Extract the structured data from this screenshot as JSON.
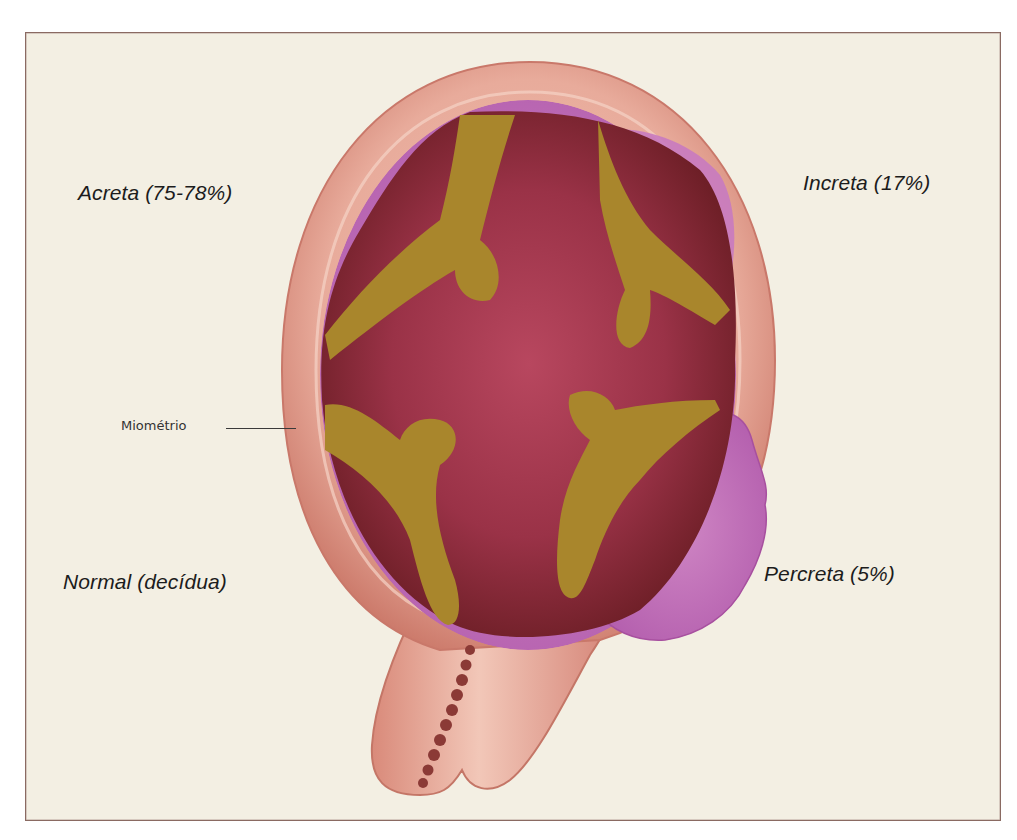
{
  "figure": {
    "labels": {
      "acreta": "Acreta (75-78%)",
      "increta": "Increta (17%)",
      "normal": "Normal (decídua)",
      "percreta": "Percreta (5%)",
      "miometrio": "Miométrio"
    },
    "colors": {
      "background": "#f3efe3",
      "frame": "#8a6a62",
      "myometrium": "#e5a597",
      "myometrium_edge": "#c9786a",
      "decidua_purple": "#b45fae",
      "villi_gold": "#a9862c",
      "placenta": "#9a3247",
      "placenta_dark": "#6e1f27",
      "cord": "#8b3a36",
      "text": "#1c1c1c"
    }
  }
}
